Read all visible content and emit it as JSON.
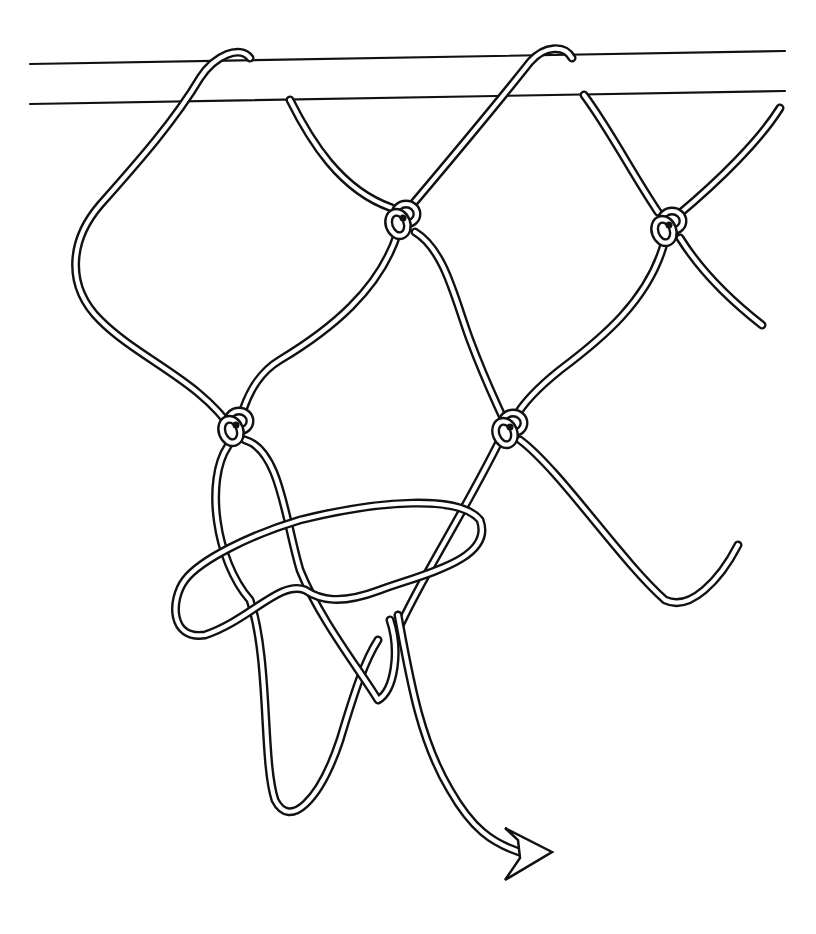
{
  "illustration": {
    "subject": "net-mesh-knot-tying-diagram",
    "background": "#ffffff",
    "ink": "#111111",
    "bar": {
      "top_line": [
        [
          30,
          64
        ],
        [
          785,
          51
        ]
      ],
      "bottom_line": [
        [
          30,
          104
        ],
        [
          785,
          91
        ]
      ]
    },
    "knots": [
      {
        "name": "knot-upper-middle",
        "x": 402,
        "y": 218
      },
      {
        "name": "knot-upper-right",
        "x": 668,
        "y": 225
      },
      {
        "name": "knot-middle-left",
        "x": 235,
        "y": 425
      },
      {
        "name": "knot-middle-right",
        "x": 509,
        "y": 427
      }
    ],
    "cords": [
      {
        "name": "cord-left-loop-over-bar",
        "d": "M 234 432 C 200 380 140 360 100 320 C 65 285 70 240 100 205 C 140 160 175 120 200 78 C 215 55 240 45 250 58"
      },
      {
        "name": "cord-bar-to-upper-middle",
        "d": "M 290 100 C 310 140 340 190 392 208"
      },
      {
        "name": "cord-upper-middle-to-middle-left",
        "d": "M 398 232 C 380 290 330 330 280 360 C 260 372 250 390 243 410"
      },
      {
        "name": "cord-upper-middle-over-bar",
        "d": "M 412 205 C 450 160 500 100 530 62 C 545 45 565 45 572 58"
      },
      {
        "name": "cord-upper-middle-to-middle-right",
        "d": "M 415 232 C 445 250 455 300 470 340 C 485 380 495 400 503 418"
      },
      {
        "name": "cord-bar-to-upper-right",
        "d": "M 584 95 C 610 130 630 170 658 212"
      },
      {
        "name": "cord-upper-right-to-far-right",
        "d": "M 678 215 C 720 180 760 140 780 108"
      },
      {
        "name": "cord-upper-right-to-middle-right",
        "d": "M 665 240 C 650 300 600 340 560 370 C 535 390 522 405 515 418"
      },
      {
        "name": "cord-upper-right-lower-end",
        "d": "M 680 238 C 700 270 730 300 762 325"
      },
      {
        "name": "cord-middle-right-zigzag",
        "d": "M 520 440 C 560 470 620 560 665 600 C 690 612 720 580 738 545"
      },
      {
        "name": "cord-middle-right-to-crossing",
        "d": "M 500 440 C 460 520 420 580 398 630"
      },
      {
        "name": "cord-left-long-bight",
        "d": "M 228 446 C 205 480 215 560 250 600 C 270 660 262 760 275 800 C 290 830 320 800 340 740 C 355 690 365 660 378 640"
      },
      {
        "name": "cord-middle-left-loop-down",
        "d": "M 245 440 C 280 450 285 520 300 570 C 320 620 360 670 378 700 C 395 690 400 650 390 620"
      },
      {
        "name": "cord-horizontal-loop",
        "d": "M 300 520 C 380 500 460 495 480 520 C 495 560 420 575 380 590 C 340 605 320 600 305 590 C 280 580 250 620 205 635 C 170 640 170 600 185 580 C 200 560 250 535 300 520"
      },
      {
        "name": "cord-working-end-tail",
        "d": "M 398 615 C 410 680 420 740 450 790 C 470 825 490 845 530 855"
      }
    ],
    "arrow": {
      "name": "working-end-arrowhead",
      "points": "505,828 552,852 505,880 520,858 518,840"
    }
  }
}
